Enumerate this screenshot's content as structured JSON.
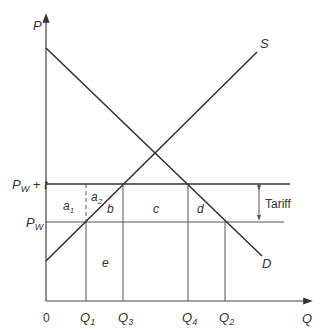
{
  "diagram": {
    "axes": {
      "y_label": "P",
      "x_label": "Q",
      "origin": "0"
    },
    "price_levels": {
      "upper": {
        "base": "P",
        "sub": "W",
        "suffix": " + t"
      },
      "lower": {
        "base": "P",
        "sub": "W"
      }
    },
    "curves": {
      "supply": "S",
      "demand": "D"
    },
    "quantities": [
      {
        "base": "Q",
        "sub": "1"
      },
      {
        "base": "Q",
        "sub": "3"
      },
      {
        "base": "Q",
        "sub": "4"
      },
      {
        "base": "Q",
        "sub": "2"
      }
    ],
    "areas": {
      "a1": {
        "base": "a",
        "sub": "1"
      },
      "a2": {
        "base": "a",
        "sub": "2"
      },
      "b": "b",
      "c": "c",
      "d": "d",
      "e": "e"
    },
    "tariff_label": "Tariff",
    "colors": {
      "line": "#333333",
      "thin": "#555555"
    }
  }
}
